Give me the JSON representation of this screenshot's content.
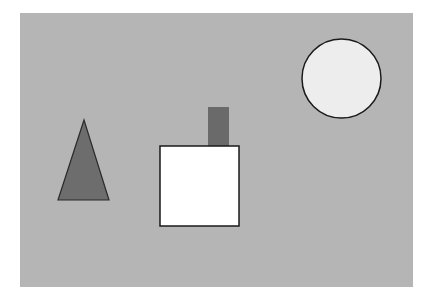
{
  "scene": {
    "width": 430,
    "height": 303,
    "page_background": "#ffffff",
    "canvas": {
      "x": 20,
      "y": 13,
      "width": 393,
      "height": 274,
      "fill": "#b5b5b5"
    },
    "shapes": [
      {
        "type": "triangle",
        "name": "dark-triangle",
        "points": [
          [
            84,
            120
          ],
          [
            58,
            200
          ],
          [
            109,
            200
          ]
        ],
        "fill": "#6d6d6d",
        "stroke": "#2a2a2a"
      },
      {
        "type": "rect",
        "name": "chimney",
        "x": 208,
        "y": 107,
        "width": 21,
        "height": 39,
        "fill": "#6a6a6a",
        "stroke": "none"
      },
      {
        "type": "rect",
        "name": "white-square",
        "x": 160,
        "y": 146,
        "width": 79,
        "height": 80,
        "fill": "#ffffff",
        "stroke": "#1a1a1a"
      },
      {
        "type": "circle",
        "name": "light-circle",
        "cx": 341.5,
        "cy": 78.5,
        "r": 39.5,
        "fill": "#ededed",
        "stroke": "#1a1a1a"
      }
    ]
  }
}
